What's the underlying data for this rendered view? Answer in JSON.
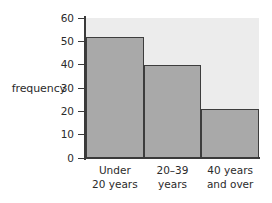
{
  "chart_data": {
    "type": "bar",
    "title": "",
    "xlabel": "",
    "ylabel": "frequency",
    "categories": [
      "Under 20 years",
      "20–39 years",
      "40 years and over"
    ],
    "category_lines": [
      [
        "Under",
        "20 years"
      ],
      [
        "20–39",
        "years"
      ],
      [
        "40 years",
        "and over"
      ]
    ],
    "values": [
      52,
      40,
      21
    ],
    "ylim": [
      0,
      60
    ],
    "yticks": [
      0,
      10,
      20,
      30,
      40,
      50,
      60
    ],
    "ytick_labels": [
      "0",
      "10",
      "20",
      "30",
      "40",
      "50",
      "60"
    ],
    "grid": false,
    "legend": false,
    "bar_style": "contiguous-histogram",
    "colors": {
      "bar_fill": "#a9a9a9",
      "bar_border": "#3d3d3d",
      "panel_background": "#ececec",
      "axis": "#3a3a3a",
      "text": "#2b2b2b",
      "page_background": "#ffffff"
    }
  }
}
